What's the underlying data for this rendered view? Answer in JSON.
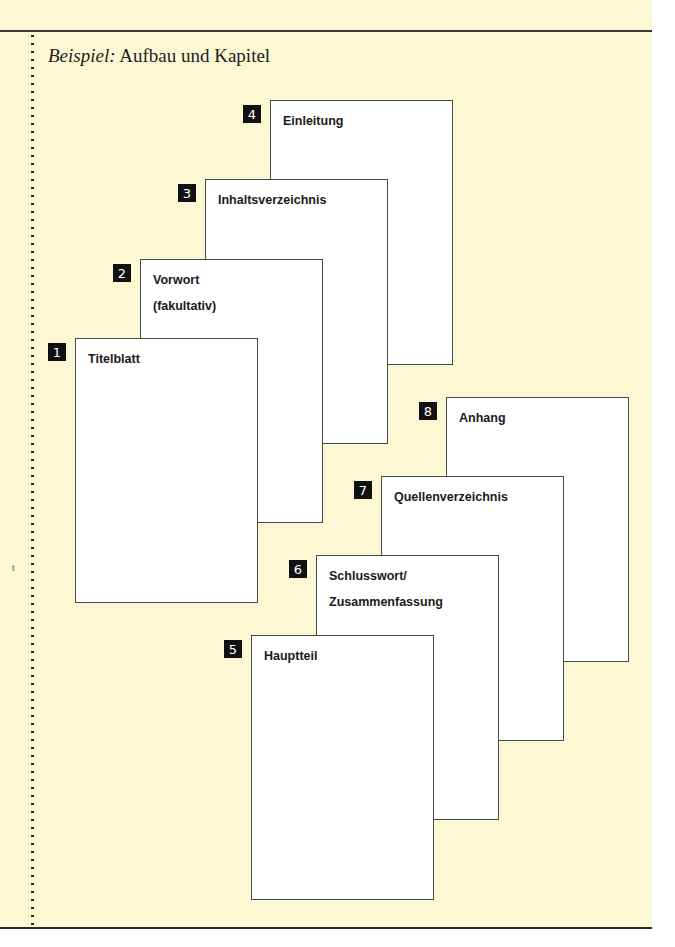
{
  "title": {
    "prefix": "Beispiel:",
    "text": " Aufbau und Kapitel"
  },
  "colors": {
    "background": "#fcf8d4",
    "page_fill": "#ffffff",
    "page_border": "#4a4a4a",
    "badge_fill": "#111111",
    "badge_text": "#ffffff"
  },
  "pages": [
    {
      "number": "1",
      "label": "Titelblatt"
    },
    {
      "number": "2",
      "label": "Vorwort\n(fakultativ)"
    },
    {
      "number": "3",
      "label": "Inhaltsverzeichnis"
    },
    {
      "number": "4",
      "label": "Einleitung"
    },
    {
      "number": "5",
      "label": "Hauptteil"
    },
    {
      "number": "6",
      "label": "Schlusswort/\nZusammenfassung"
    },
    {
      "number": "7",
      "label": "Quellenverzeichnis"
    },
    {
      "number": "8",
      "label": "Anhang"
    }
  ]
}
